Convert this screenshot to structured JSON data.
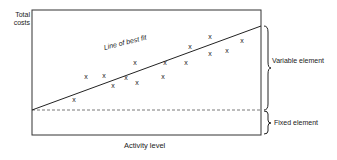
{
  "chart_data": {
    "type": "scatter",
    "title": "",
    "xlabel": "Activity level",
    "ylabel": "Total costs",
    "grid": false,
    "annotations": [
      "Line of best fit",
      "Variable element",
      "Fixed element"
    ],
    "marker": "x",
    "points_px": [
      [
        74,
        99
      ],
      [
        86,
        76
      ],
      [
        104,
        75
      ],
      [
        113,
        85
      ],
      [
        126,
        77
      ],
      [
        135,
        62
      ],
      [
        137,
        82
      ],
      [
        163,
        76
      ],
      [
        165,
        62
      ],
      [
        186,
        62
      ],
      [
        190,
        46
      ],
      [
        210,
        36
      ],
      [
        210,
        53
      ],
      [
        227,
        50
      ],
      [
        242,
        40
      ]
    ],
    "line_of_best_fit_px": {
      "x1": 32,
      "y1": 110,
      "x2": 261,
      "y2": 26
    },
    "fixed_cost_level_px": 110,
    "frame_px": {
      "left": 32,
      "top": 10,
      "right": 261,
      "bottom": 135
    }
  },
  "labels": {
    "y_axis": "Total costs",
    "x_axis": "Activity level",
    "best_fit": "Line of best fit",
    "variable": "Variable element",
    "fixed": "Fixed element"
  },
  "colors": {
    "ink": "#222222",
    "background": "#ffffff"
  }
}
